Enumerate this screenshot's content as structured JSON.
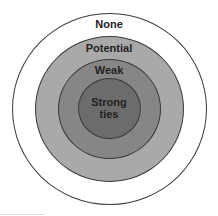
{
  "diagram": {
    "title": "",
    "rings": [
      {
        "label": "None",
        "color": "#ffffff"
      },
      {
        "label": "Potential",
        "color": "#a9a9a9"
      },
      {
        "label": "Weak",
        "color": "#868686"
      },
      {
        "label": "Strong ties",
        "line1": "Strong",
        "line2": "ties",
        "color": "#6c6c6c"
      }
    ]
  }
}
